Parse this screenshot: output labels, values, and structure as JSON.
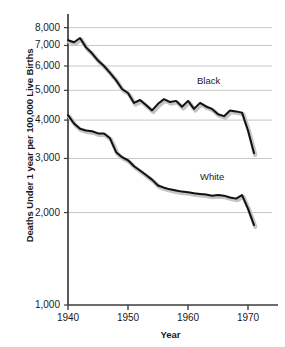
{
  "chart_data": {
    "type": "line",
    "title": "",
    "xlabel": "Year",
    "ylabel": "Deaths Under 1 year per 100,000 Live Births",
    "yscale": "log",
    "ylim": [
      1000,
      8600
    ],
    "xlim": [
      1940,
      1974
    ],
    "grid": "horizontal",
    "legend_position": "inline-annotations",
    "yticks": [
      "8,000",
      "7,000",
      "6,000",
      "5,000",
      "4,000",
      "3,000",
      "2,000",
      "1,000"
    ],
    "ytick_values": [
      8000,
      7000,
      6000,
      5000,
      4000,
      3000,
      2000,
      1000
    ],
    "xticks": [
      "1940",
      "1950",
      "1960",
      "1970"
    ],
    "xtick_values": [
      1940,
      1950,
      1960,
      1970
    ],
    "x": [
      1940,
      1941,
      1942,
      1943,
      1944,
      1945,
      1946,
      1947,
      1948,
      1949,
      1950,
      1951,
      1952,
      1953,
      1954,
      1955,
      1956,
      1957,
      1958,
      1959,
      1960,
      1961,
      1962,
      1963,
      1964,
      1965,
      1966,
      1967,
      1968,
      1969,
      1970,
      1971
    ],
    "series": [
      {
        "name": "Black",
        "color": "#111111",
        "values": [
          7280,
          7170,
          7400,
          6900,
          6600,
          6250,
          6000,
          5700,
          5400,
          5050,
          4900,
          4550,
          4650,
          4480,
          4300,
          4520,
          4680,
          4580,
          4620,
          4420,
          4620,
          4350,
          4550,
          4430,
          4350,
          4180,
          4120,
          4300,
          4270,
          4230,
          3700,
          3120
        ]
      },
      {
        "name": "White",
        "color": "#111111",
        "values": [
          4150,
          3900,
          3750,
          3700,
          3680,
          3620,
          3620,
          3490,
          3150,
          3030,
          2960,
          2830,
          2740,
          2650,
          2560,
          2450,
          2410,
          2380,
          2360,
          2340,
          2330,
          2310,
          2300,
          2290,
          2270,
          2280,
          2270,
          2240,
          2220,
          2280,
          2060,
          1820
        ]
      }
    ],
    "annotations": [
      {
        "text": "Black",
        "x": 1961.5,
        "y": 5350
      },
      {
        "text": "White",
        "x": 1962.0,
        "y": 2620
      }
    ]
  }
}
